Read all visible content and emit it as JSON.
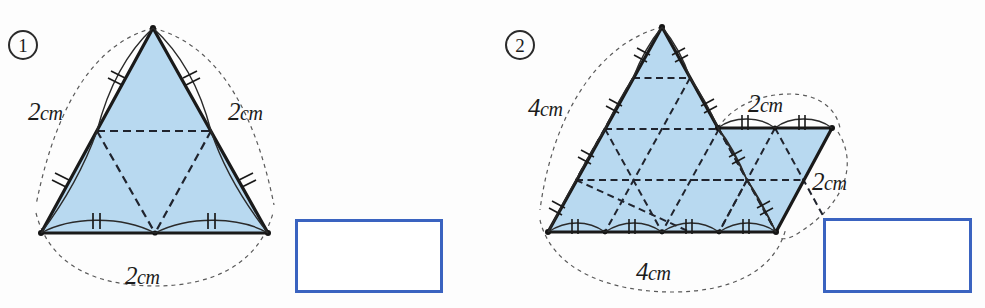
{
  "page": {
    "width": 985,
    "height": 308,
    "background": "#fdfdfd",
    "kind": "math-worksheet-figure"
  },
  "style": {
    "fill_color": "#b8d9f0",
    "outline_color": "#1a1a1a",
    "dashed_color": "#20242e",
    "guide_color": "#5a5a5a",
    "answer_box_border": "#3a63c0",
    "label_color": "#1b1b1b"
  },
  "problems": [
    {
      "id": "problem-1",
      "number": "1",
      "number_position": {
        "x": 8,
        "y": 30
      },
      "shape": {
        "name": "equilateral-triangle-side-2cm",
        "type": "triangle",
        "subdivisions": 2,
        "apex": {
          "x": 153,
          "y": 28
        },
        "bottom_left": {
          "x": 41,
          "y": 233
        },
        "bottom_right": {
          "x": 268,
          "y": 233
        }
      },
      "dimension_labels": [
        {
          "name": "left-side-length",
          "value": "2",
          "unit": "cm",
          "x": 28,
          "y": 98
        },
        {
          "name": "right-side-length",
          "value": "2",
          "unit": "cm",
          "x": 228,
          "y": 98
        },
        {
          "name": "base-length",
          "value": "2",
          "unit": "cm",
          "x": 125,
          "y": 262
        }
      ],
      "answer_box": {
        "name": "answer-box-1",
        "x": 295,
        "y": 219,
        "width": 148,
        "height": 74
      }
    },
    {
      "id": "problem-2",
      "number": "2",
      "number_position": {
        "x": 505,
        "y": 30
      },
      "shape": {
        "name": "triangle-with-parallelogram",
        "type": "composite",
        "triangle_subdivisions": 4,
        "apex": {
          "x": 662,
          "y": 27
        },
        "bottom_left": {
          "x": 548,
          "y": 232
        },
        "bottom_right": {
          "x": 776,
          "y": 232
        },
        "parallelogram_top_left": {
          "x": 718,
          "y": 128
        },
        "parallelogram_top_right": {
          "x": 832,
          "y": 128
        }
      },
      "dimension_labels": [
        {
          "name": "triangle-left-side-length",
          "value": "4",
          "unit": "cm",
          "x": 528,
          "y": 94
        },
        {
          "name": "parallelogram-top-length",
          "value": "2",
          "unit": "cm",
          "x": 748,
          "y": 90
        },
        {
          "name": "parallelogram-side-length",
          "value": "2",
          "unit": "cm",
          "x": 812,
          "y": 168
        },
        {
          "name": "triangle-base-length",
          "value": "4",
          "unit": "cm",
          "x": 636,
          "y": 258
        }
      ],
      "answer_box": {
        "name": "answer-box-2",
        "x": 823,
        "y": 218,
        "width": 149,
        "height": 75
      }
    }
  ]
}
